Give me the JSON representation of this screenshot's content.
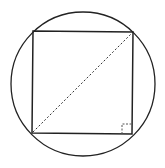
{
  "diagram": {
    "colors": {
      "stroke": "#222222",
      "background": "#ffffff"
    },
    "circle": {
      "cx": 83,
      "cy": 84,
      "r": 72
    },
    "square": {
      "x1": 33,
      "y1": 32,
      "x2": 133,
      "y2": 134
    },
    "diagonal": {
      "from": "bottom-left",
      "to": "top-right",
      "style": "dashed"
    },
    "right_angle_marker": {
      "corner": "bottom-right",
      "size": 10
    }
  }
}
